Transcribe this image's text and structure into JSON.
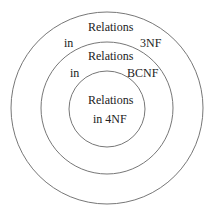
{
  "diagram": {
    "type": "nested-circles",
    "stroke_color": "#777777",
    "circles": [
      {
        "name": "3NF",
        "label_top": "Relations",
        "label_left": "in",
        "label_right": "3NF"
      },
      {
        "name": "BCNF",
        "label_top": "Relations",
        "label_left": "in",
        "label_right": "BCNF"
      },
      {
        "name": "4NF",
        "label_line1": "Relations",
        "label_line2": "in 4NF"
      }
    ]
  }
}
